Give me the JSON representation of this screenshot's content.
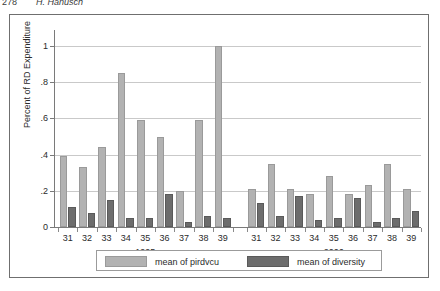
{
  "page_header": {
    "folio": "278",
    "running_title": "H. Hanusch"
  },
  "legend": {
    "position": "bottom-center",
    "entries": [
      {
        "label": "mean of pirdvcu",
        "color": "#b2b2b2",
        "swatch": "light-gray-swatch"
      },
      {
        "label": "mean of diversity",
        "color": "#6d6d6d",
        "swatch": "dark-gray-swatch"
      }
    ]
  },
  "chart_data": {
    "type": "bar",
    "title": "",
    "xlabel": "",
    "ylabel": "Percent of RD Expenditure",
    "ylim": [
      0,
      1
    ],
    "yticks": [
      0,
      0.2,
      0.4,
      0.6,
      0.8,
      1
    ],
    "ytick_labels": [
      "0",
      ".2",
      ".4",
      ".6",
      ".8",
      "1"
    ],
    "grid": true,
    "grouped": true,
    "group_labels": [
      "1995",
      "2006"
    ],
    "categories": [
      "31",
      "32",
      "33",
      "34",
      "35",
      "36",
      "37",
      "38",
      "39"
    ],
    "groups": [
      {
        "name": "1995",
        "series": [
          {
            "name": "mean of pirdvcu",
            "values": [
              0.39,
              0.33,
              0.44,
              0.85,
              0.59,
              0.5,
              0.2,
              0.59,
              1.0
            ]
          },
          {
            "name": "mean of diversity",
            "values": [
              0.11,
              0.08,
              0.15,
              0.05,
              0.05,
              0.18,
              0.03,
              0.06,
              0.05
            ]
          }
        ]
      },
      {
        "name": "2006",
        "series": [
          {
            "name": "mean of pirdvcu",
            "values": [
              0.21,
              0.35,
              0.21,
              0.18,
              0.28,
              0.18,
              0.23,
              0.35,
              0.21
            ]
          },
          {
            "name": "mean of diversity",
            "values": [
              0.13,
              0.06,
              0.17,
              0.04,
              0.05,
              0.16,
              0.03,
              0.05,
              0.09
            ]
          }
        ]
      }
    ]
  }
}
